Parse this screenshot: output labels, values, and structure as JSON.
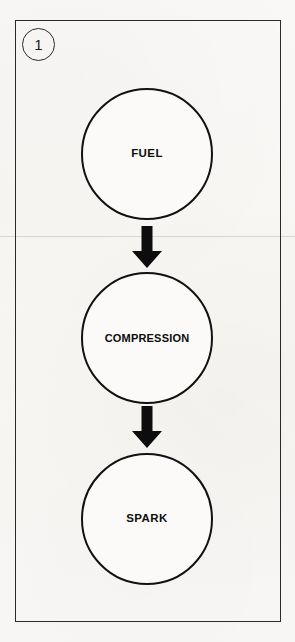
{
  "figure": {
    "step_number": "1",
    "frame_color": "#2a2a2a",
    "background_color": "#f8f7f5",
    "ink_color": "#111111"
  },
  "diagram": {
    "type": "flowchart",
    "orientation": "vertical",
    "node_shape": "circle",
    "nodes": [
      {
        "id": "fuel",
        "label": "FUEL"
      },
      {
        "id": "compression",
        "label": "COMPRESSION"
      },
      {
        "id": "spark",
        "label": "SPARK"
      }
    ],
    "connectors": [
      {
        "id": "fuel-to-compression",
        "from": "fuel",
        "to": "compression",
        "icon": "arrow-down-icon"
      },
      {
        "id": "compression-to-spark",
        "from": "compression",
        "to": "spark",
        "icon": "arrow-down-icon"
      }
    ]
  }
}
